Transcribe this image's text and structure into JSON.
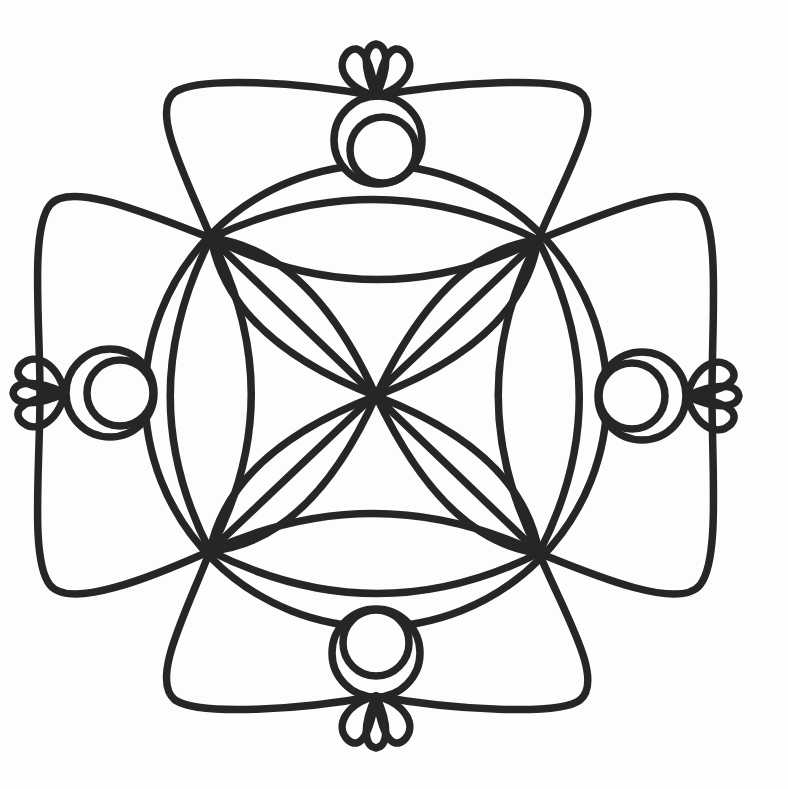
{
  "artwork": {
    "kind": "mandala coloring page",
    "background": "#fdfdfd",
    "stroke_color": "#262626",
    "stroke_width": 7.5,
    "center": [
      376,
      396
    ],
    "corner_nodes": {
      "top_left": [
        211,
        238
      ],
      "top_right": [
        538,
        240
      ],
      "bottom_left": [
        210,
        551
      ],
      "bottom_right": [
        539,
        553
      ]
    },
    "outer_circle": {
      "cx": 376,
      "cy": 396,
      "r": 231
    },
    "paths": {
      "outer_petals": [
        "M 211 238 C 185 175, 150 110, 175 92 C 200 76, 300 82, 376 96 C 452 82, 560 76, 580 92 C 605 110, 565 175, 538 240",
        "M 538 240 C 600 215, 680 180, 700 205 C 720 230, 712 320, 712 395 C 712 470, 720 560, 700 585 C 680 610, 600 578, 539 553",
        "M 539 553 C 565 615, 605 680, 580 700 C 560 716, 452 710, 376 696 C 300 710, 200 716, 175 700 C 150 680, 185 615, 210 551",
        "M 210 551 C 150 578, 70 610, 50 585 C 30 560, 40 470, 40 393 C 40 320, 30 230, 50 205 C 70 180, 150 215, 211 238"
      ],
      "inner_lens_arcs": [
        "M 211 238 Q 376 160, 538 240",
        "M 211 238 Q 376 320, 538 240",
        "M 210 551 Q 376 475, 539 553",
        "M 210 551 Q 376 635, 539 553",
        "M 211 238 Q 130 396, 210 551",
        "M 211 238 Q 292 396, 210 551",
        "M 538 240 Q 458 396, 539 553",
        "M 538 240 Q 620 396, 539 553"
      ],
      "diagonals": [
        "M 211 238 L 539 553",
        "M 538 240 L 210 551"
      ],
      "center_petals": [
        "M 211 238 Q 230 340, 376 396",
        "M 211 238 Q 310 250, 376 396",
        "M 538 240 Q 445 250, 376 396",
        "M 538 240 Q 522 340, 376 396",
        "M 539 553 Q 522 452, 376 396",
        "M 539 553 Q 445 542, 376 396",
        "M 210 551 Q 310 542, 376 396",
        "M 210 551 Q 230 452, 376 396"
      ]
    },
    "ornaments": [
      {
        "position": "top",
        "outer_circle": {
          "cx": 378,
          "cy": 140,
          "r": 44
        },
        "inner_circle": {
          "cx": 383,
          "cy": 150,
          "r": 33
        },
        "shell_anchor": [
          376,
          96
        ],
        "shell_direction": "up"
      },
      {
        "position": "bottom",
        "outer_circle": {
          "cx": 376,
          "cy": 653,
          "r": 44
        },
        "inner_circle": {
          "cx": 376,
          "cy": 643,
          "r": 33
        },
        "shell_anchor": [
          376,
          696
        ],
        "shell_direction": "down"
      },
      {
        "position": "left",
        "outer_circle": {
          "cx": 110,
          "cy": 393,
          "r": 44
        },
        "inner_circle": {
          "cx": 120,
          "cy": 393,
          "r": 33
        },
        "shell_anchor": [
          65,
          393
        ],
        "shell_direction": "left"
      },
      {
        "position": "right",
        "outer_circle": {
          "cx": 642,
          "cy": 396,
          "r": 44
        },
        "inner_circle": {
          "cx": 632,
          "cy": 396,
          "r": 33
        },
        "shell_anchor": [
          687,
          396
        ],
        "shell_direction": "right"
      }
    ],
    "shell": {
      "lobes": 3,
      "paths_up": [
        "M 0 0 C -30 -8, -42 -30, -28 -44 C -16 -54, -6 -40, 0 0",
        "M 0 0 C -14 -30, -12 -50, 0 -52 C 12 -50, 14 -30, 0 0",
        "M 0 0 C 30 -8, 42 -30, 28 -44 C 16 -54, 6 -40, 0 0"
      ]
    }
  }
}
